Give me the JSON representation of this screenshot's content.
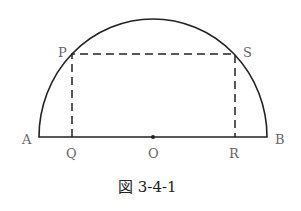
{
  "figure": {
    "caption": "図 3-4-1",
    "points": {
      "A": "A",
      "B": "B",
      "O": "O",
      "P": "P",
      "Q": "Q",
      "R": "R",
      "S": "S"
    }
  }
}
